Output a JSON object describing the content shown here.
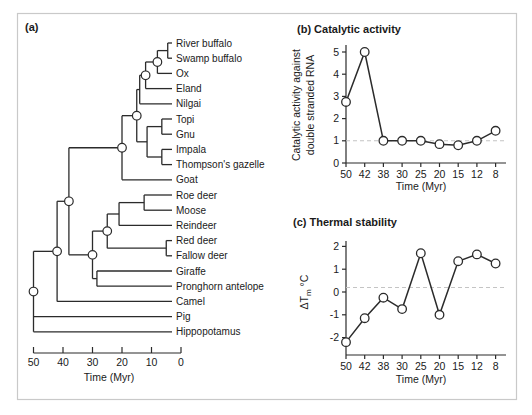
{
  "figure": {
    "panel_a_label": "(a)"
  },
  "tree": {
    "time_axis": {
      "label": "Time (Myr)",
      "ticks": [
        50,
        40,
        30,
        20,
        10,
        0
      ]
    },
    "circled_ancestor_ages_myr": [
      50,
      42,
      38,
      30,
      25,
      20,
      15,
      12,
      8
    ],
    "topology": {
      "age": 50,
      "circled": true,
      "children": [
        {
          "age": 42,
          "circled": true,
          "children": [
            {
              "age": 38,
              "circled": true,
              "children": [
                {
                  "age": 20,
                  "circled": true,
                  "children": [
                    {
                      "age": 15,
                      "circled": true,
                      "children": [
                        {
                          "age": 14,
                          "children": [
                            {
                              "age": 12,
                              "circled": true,
                              "children": [
                                {
                                  "age": 8,
                                  "circled": true,
                                  "children": [
                                    {
                                      "age": 4.5,
                                      "children": [
                                        {
                                          "name": "River buffalo"
                                        },
                                        {
                                          "name": "Swamp buffalo"
                                        }
                                      ]
                                    },
                                    {
                                      "name": "Ox"
                                    }
                                  ]
                                },
                                {
                                  "name": "Eland"
                                }
                              ]
                            },
                            {
                              "name": "Nilgai"
                            }
                          ]
                        },
                        {
                          "age": 11.5,
                          "children": [
                            {
                              "age": 6.5,
                              "children": [
                                {
                                  "name": "Topi"
                                },
                                {
                                  "name": "Gnu"
                                }
                              ]
                            },
                            {
                              "age": 6.5,
                              "children": [
                                {
                                  "name": "Impala"
                                },
                                {
                                  "name": "Thompson's gazelle"
                                }
                              ]
                            }
                          ]
                        }
                      ]
                    },
                    {
                      "name": "Goat"
                    }
                  ]
                },
                {
                  "age": 30,
                  "circled": true,
                  "children": [
                    {
                      "age": 25,
                      "circled": true,
                      "children": [
                        {
                          "age": 21,
                          "children": [
                            {
                              "age": 12.5,
                              "children": [
                                {
                                  "name": "Roe deer"
                                },
                                {
                                  "name": "Moose"
                                }
                              ]
                            },
                            {
                              "name": "Reindeer"
                            }
                          ]
                        },
                        {
                          "age": 5,
                          "children": [
                            {
                              "name": "Red deer"
                            },
                            {
                              "name": "Fallow deer"
                            }
                          ]
                        }
                      ]
                    },
                    {
                      "age": 28.5,
                      "children": [
                        {
                          "name": "Giraffe"
                        },
                        {
                          "name": "Pronghorn antelope"
                        }
                      ]
                    }
                  ]
                }
              ]
            },
            {
              "name": "Camel"
            }
          ]
        },
        {
          "name": "Pig"
        },
        {
          "name": "Hippopotamus"
        }
      ]
    }
  },
  "chart_data": [
    {
      "type": "line",
      "title": "(b) Catalytic activity",
      "categories": [
        "50",
        "42",
        "38",
        "30",
        "25",
        "20",
        "15",
        "12",
        "8"
      ],
      "values": [
        2.75,
        5.0,
        1.0,
        1.0,
        1.0,
        0.85,
        0.8,
        1.0,
        1.45
      ],
      "xlabel": "Time (Myr)",
      "ylabel_line1": "Catalytic activity against",
      "ylabel_line2": "double stranded RNA",
      "ylim": [
        0,
        5
      ],
      "yticks": [
        5,
        4,
        3,
        2,
        1,
        0
      ],
      "reference_line": 1.0,
      "marker": "open-circle",
      "grid": false,
      "legend": "none"
    },
    {
      "type": "line",
      "title": "(c) Thermal stability",
      "categories": [
        "50",
        "42",
        "38",
        "30",
        "25",
        "20",
        "15",
        "12",
        "8"
      ],
      "values": [
        -2.2,
        -1.15,
        -0.25,
        -0.75,
        1.7,
        -1.0,
        1.35,
        1.65,
        1.25
      ],
      "xlabel": "Time (Myr)",
      "ylabel_main": "ΔT",
      "ylabel_sub": "m",
      "ylabel_unit": " °C",
      "ylim": [
        -2,
        2
      ],
      "yticks": [
        2,
        1,
        0,
        -1,
        -2
      ],
      "reference_line": 0.2,
      "marker": "open-circle",
      "grid": false,
      "legend": "none"
    }
  ]
}
